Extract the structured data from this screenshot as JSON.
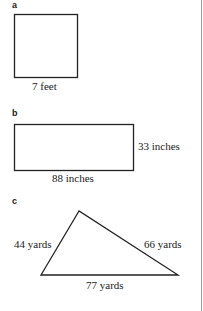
{
  "figures": {
    "a": {
      "label": "a",
      "shape": "square",
      "side": "7 feet"
    },
    "b": {
      "label": "b",
      "shape": "rectangle",
      "width": "88 inches",
      "height": "33 inches"
    },
    "c": {
      "label": "c",
      "shape": "triangle",
      "left_side": "44 yards",
      "right_side": "66 yards",
      "base": "77 yards"
    }
  }
}
